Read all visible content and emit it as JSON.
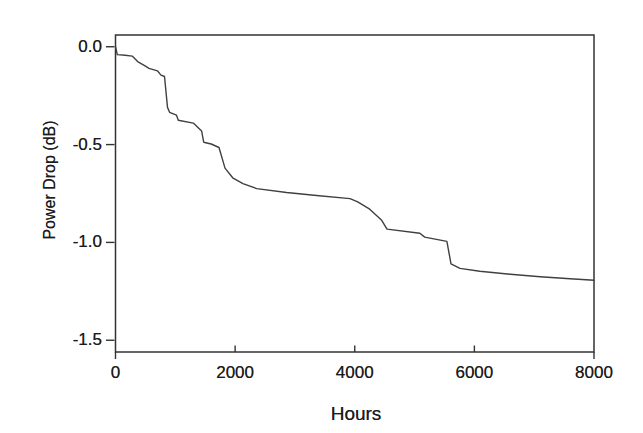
{
  "figure": {
    "x_axis_title": "Hours",
    "y_axis_title": "Power Drop (dB)"
  },
  "colors": {
    "background": "#ffffff",
    "frame": "#333333",
    "curve": "#404040",
    "text": "#1c1c1c"
  },
  "chart_data": {
    "type": "line",
    "title": "",
    "xlabel": "Hours",
    "ylabel": "Power Drop (dB)",
    "xlim": [
      0,
      8000
    ],
    "ylim": [
      -1.56,
      0.06
    ],
    "x_ticks": [
      0,
      2000,
      4000,
      6000,
      8000
    ],
    "x_tick_labels": [
      "0",
      "2000",
      "4000",
      "6000",
      "8000"
    ],
    "y_ticks": [
      0.0,
      -0.5,
      -1.0,
      -1.5
    ],
    "y_tick_labels": [
      "0.0",
      "-0.5",
      "-1.0",
      "-1.5"
    ],
    "grid": false,
    "legend": false,
    "series": [
      {
        "name": "power-drop-curve",
        "points": [
          [
            0,
            0.0
          ],
          [
            30,
            -0.04
          ],
          [
            160,
            -0.043
          ],
          [
            280,
            -0.048
          ],
          [
            370,
            -0.076
          ],
          [
            480,
            -0.095
          ],
          [
            560,
            -0.11
          ],
          [
            700,
            -0.123
          ],
          [
            760,
            -0.145
          ],
          [
            820,
            -0.152
          ],
          [
            870,
            -0.31
          ],
          [
            905,
            -0.335
          ],
          [
            1020,
            -0.35
          ],
          [
            1050,
            -0.376
          ],
          [
            1300,
            -0.39
          ],
          [
            1440,
            -0.43
          ],
          [
            1475,
            -0.488
          ],
          [
            1600,
            -0.497
          ],
          [
            1730,
            -0.515
          ],
          [
            1830,
            -0.62
          ],
          [
            1960,
            -0.67
          ],
          [
            2130,
            -0.7
          ],
          [
            2360,
            -0.725
          ],
          [
            2860,
            -0.745
          ],
          [
            3360,
            -0.76
          ],
          [
            3920,
            -0.776
          ],
          [
            4050,
            -0.793
          ],
          [
            4250,
            -0.83
          ],
          [
            4450,
            -0.887
          ],
          [
            4540,
            -0.932
          ],
          [
            5090,
            -0.953
          ],
          [
            5170,
            -0.973
          ],
          [
            5540,
            -0.995
          ],
          [
            5610,
            -1.11
          ],
          [
            5760,
            -1.133
          ],
          [
            6090,
            -1.147
          ],
          [
            6600,
            -1.163
          ],
          [
            7100,
            -1.175
          ],
          [
            7600,
            -1.186
          ],
          [
            8000,
            -1.193
          ]
        ]
      }
    ]
  }
}
